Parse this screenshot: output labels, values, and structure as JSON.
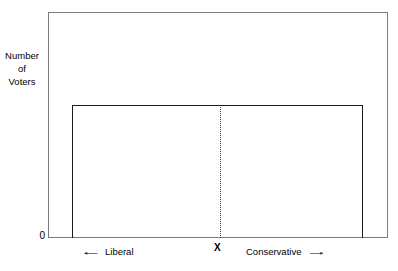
{
  "chart_data": {
    "type": "bar",
    "title": "",
    "subtitle": "",
    "xlabel": "",
    "ylabel": "Number of Voters",
    "ylabel_lines": [
      "Number",
      "of",
      "Voters"
    ],
    "categories": [
      "Liberal end",
      "X (median)",
      "Conservative end"
    ],
    "series": [
      {
        "name": "Voter distribution",
        "values": [
          1,
          1,
          1
        ]
      }
    ],
    "x": [
      0,
      0.51,
      1
    ],
    "values": [
      1,
      1,
      1
    ],
    "xlim": [
      0,
      1
    ],
    "ylim": [
      0,
      1.18
    ],
    "y_ticks": [
      "0"
    ],
    "x_ticks": [],
    "grid": false,
    "legend": false,
    "legend_position": "none",
    "annotations": [
      {
        "name": "median-marker",
        "label": "X",
        "x": 0.51,
        "style": "dotted-vertical-line"
      },
      {
        "name": "left-direction",
        "label": "Liberal",
        "arrow": "left"
      },
      {
        "name": "right-direction",
        "label": "Conservative",
        "arrow": "right"
      }
    ],
    "colors": {
      "frame": "#7a7a7a",
      "distribution_outline": "#1a1a1a",
      "median_line": "#3a3a3a",
      "background": "#ffffff",
      "text": "#000000"
    }
  },
  "axes": {
    "y_label_lines": [
      "Number",
      "of",
      "Voters"
    ],
    "y_zero_tick": "0"
  },
  "annotations": {
    "liberal_label": "Liberal",
    "conservative_label": "Conservative",
    "median_label": "X",
    "left_arrow_glyph": "left-arrow-icon",
    "right_arrow_glyph": "right-arrow-icon"
  }
}
